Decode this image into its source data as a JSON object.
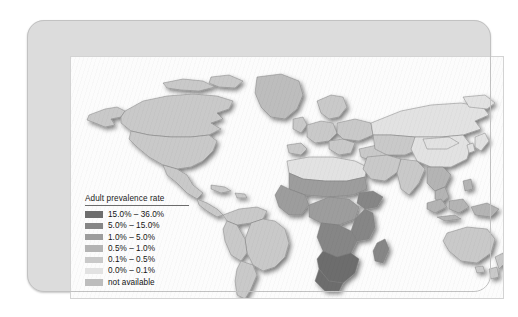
{
  "figure": {
    "kind": "choropleth-world-map",
    "legend": {
      "title": "Adult prevalence rate",
      "entries": [
        {
          "label": "15.0% – 36.0%",
          "color": "#6d6d6d",
          "min": 15.0,
          "max": 36.0
        },
        {
          "label": "5.0% – 15.0%",
          "color": "#868686",
          "min": 5.0,
          "max": 15.0
        },
        {
          "label": "1.0% – 5.0%",
          "color": "#9d9d9d",
          "min": 1.0,
          "max": 5.0
        },
        {
          "label": "0.5% – 1.0%",
          "color": "#b4b4b4",
          "min": 0.5,
          "max": 1.0
        },
        {
          "label": "0.1% – 0.5%",
          "color": "#c9c9c9",
          "min": 0.1,
          "max": 0.5
        },
        {
          "label": "0.0% – 0.1%",
          "color": "#e2e2e2",
          "min": 0.0,
          "max": 0.1
        },
        {
          "label": "not available",
          "color": "#bdbdbd",
          "min": null,
          "max": null
        }
      ]
    },
    "colors": {
      "page_background": "#ffffff",
      "card_plate": "#dcdcdc",
      "card_border": "#c2c2c2",
      "map_background": "#fcfcfc",
      "map_border": "#d3d3d3",
      "country_outline": "#7a7a7a",
      "legend_rule": "#6b6b6b"
    },
    "chart_data": {
      "type": "map",
      "title": "Adult prevalence rate",
      "projection": "equirectangular-world",
      "value_unit": "percent",
      "classes": [
        {
          "label": "15.0% – 36.0%",
          "color": "#6d6d6d"
        },
        {
          "label": "5.0% – 15.0%",
          "color": "#868686"
        },
        {
          "label": "1.0% – 5.0%",
          "color": "#9d9d9d"
        },
        {
          "label": "0.5% – 1.0%",
          "color": "#b4b4b4"
        },
        {
          "label": "0.1% – 0.5%",
          "color": "#c9c9c9"
        },
        {
          "label": "0.0% – 0.1%",
          "color": "#e2e2e2"
        },
        {
          "label": "not available",
          "color": "#bdbdbd"
        }
      ],
      "regions": [
        {
          "name": "Southern Africa",
          "class": "15.0% – 36.0%"
        },
        {
          "name": "Eastern Africa",
          "class": "5.0% – 15.0%"
        },
        {
          "name": "Central Africa",
          "class": "1.0% – 5.0%"
        },
        {
          "name": "Western Africa",
          "class": "1.0% – 5.0%"
        },
        {
          "name": "Northern Africa",
          "class": "0.0% – 0.1%"
        },
        {
          "name": "South America",
          "class": "0.1% – 0.5%"
        },
        {
          "name": "North America",
          "class": "0.1% – 0.5%"
        },
        {
          "name": "Western Europe",
          "class": "0.1% – 0.5%"
        },
        {
          "name": "Eastern Europe",
          "class": "0.1% – 0.5%"
        },
        {
          "name": "Russia",
          "class": "0.0% – 0.1%"
        },
        {
          "name": "China",
          "class": "0.0% – 0.1%"
        },
        {
          "name": "South Asia",
          "class": "0.1% – 0.5%"
        },
        {
          "name": "Southeast Asia",
          "class": "0.5% – 1.0%"
        },
        {
          "name": "Australia",
          "class": "0.1% – 0.5%"
        },
        {
          "name": "Greenland",
          "class": "not available"
        }
      ],
      "legend_position": "bottom-left"
    }
  }
}
